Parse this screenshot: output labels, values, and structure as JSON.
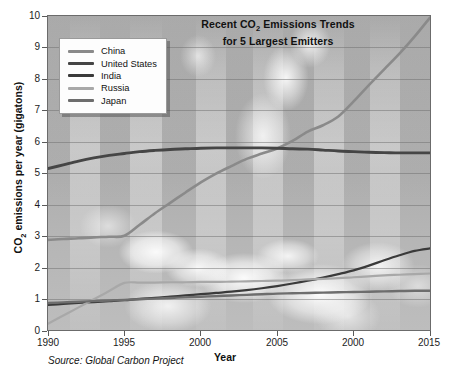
{
  "chart_data": {
    "type": "line",
    "title": "Recent CO2 Emissions Trends for 5 Largest Emitters",
    "title_line1": "Recent CO",
    "title_line1_sub": "2",
    "title_line1_rest": " Emissions Trends",
    "title_line2": "for 5 Largest Emitters",
    "xlabel": "Year",
    "ylabel_pre": "CO",
    "ylabel_sub": "2",
    "ylabel_post": " emissions per year (gigatons)",
    "ylabel": "CO2 emissions per year (gigatons)",
    "source": "Source: Global Carbon Project",
    "xlim": [
      1990,
      2015
    ],
    "ylim": [
      0,
      10
    ],
    "xticks": [
      1990,
      1995,
      2000,
      2005,
      2010,
      2015
    ],
    "xtick_labels": [
      "1990",
      "1995",
      "2000",
      "2005",
      "2000",
      "2015"
    ],
    "yticks": [
      0,
      1,
      2,
      3,
      4,
      5,
      6,
      7,
      8,
      9,
      10
    ],
    "ytick_labels": [
      "0",
      "1",
      "2",
      "3",
      "4",
      "5",
      "6",
      "7",
      "8",
      "9",
      "10"
    ],
    "grid": true,
    "grid_axis": "y",
    "legend_position": "upper-left-inside",
    "x": [
      1990,
      1991,
      1992,
      1993,
      1994,
      1995,
      1996,
      1997,
      1998,
      1999,
      2000,
      2001,
      2002,
      2003,
      2004,
      2005,
      2006,
      2007,
      2008,
      2009,
      2010,
      2011,
      2012,
      2013,
      2014,
      2015
    ],
    "series": [
      {
        "name": "China",
        "color": "#8a8a8a",
        "width": 2.6,
        "values": [
          2.87,
          2.9,
          2.92,
          2.95,
          2.97,
          3.0,
          3.35,
          3.72,
          4.05,
          4.38,
          4.7,
          4.98,
          5.22,
          5.45,
          5.62,
          5.78,
          6.02,
          6.32,
          6.52,
          6.8,
          7.28,
          7.8,
          8.3,
          8.8,
          9.35,
          9.95
        ]
      },
      {
        "name": "United States",
        "color": "#454545",
        "width": 2.9,
        "values": [
          5.14,
          5.26,
          5.38,
          5.48,
          5.56,
          5.62,
          5.68,
          5.72,
          5.75,
          5.77,
          5.79,
          5.8,
          5.8,
          5.8,
          5.8,
          5.79,
          5.77,
          5.76,
          5.73,
          5.7,
          5.68,
          5.66,
          5.65,
          5.64,
          5.64,
          5.64
        ]
      },
      {
        "name": "India",
        "color": "#3a3a3a",
        "width": 2.2,
        "values": [
          0.8,
          0.83,
          0.86,
          0.89,
          0.92,
          0.95,
          0.99,
          1.02,
          1.06,
          1.1,
          1.14,
          1.18,
          1.22,
          1.27,
          1.33,
          1.4,
          1.48,
          1.57,
          1.67,
          1.78,
          1.9,
          2.05,
          2.22,
          2.38,
          2.52,
          2.6
        ]
      },
      {
        "name": "Russia",
        "color": "#a8a8a8",
        "width": 2.2,
        "values": [
          0.2,
          0.46,
          0.72,
          0.98,
          1.24,
          1.5,
          1.51,
          1.51,
          1.52,
          1.52,
          1.53,
          1.53,
          1.54,
          1.55,
          1.56,
          1.57,
          1.59,
          1.61,
          1.63,
          1.65,
          1.68,
          1.71,
          1.74,
          1.76,
          1.78,
          1.8
        ]
      },
      {
        "name": "Japan",
        "color": "#6d6d6d",
        "width": 2.4,
        "values": [
          0.86,
          0.88,
          0.9,
          0.92,
          0.94,
          0.96,
          0.98,
          1.0,
          1.02,
          1.04,
          1.06,
          1.08,
          1.1,
          1.12,
          1.14,
          1.16,
          1.17,
          1.18,
          1.19,
          1.2,
          1.21,
          1.22,
          1.23,
          1.24,
          1.25,
          1.25
        ]
      }
    ],
    "legend_entries": [
      {
        "label": "China",
        "color": "#8a8a8a"
      },
      {
        "label": "United States",
        "color": "#454545"
      },
      {
        "label": "India",
        "color": "#3a3a3a"
      },
      {
        "label": "Russia",
        "color": "#a8a8a8"
      },
      {
        "label": "Japan",
        "color": "#6d6d6d"
      }
    ],
    "background_image": "smokestack-clouds-photo",
    "plot_bg_color": "#b5b5b5",
    "frame_color": "#6b6b6b",
    "grid_color": "#6e6e6e"
  }
}
